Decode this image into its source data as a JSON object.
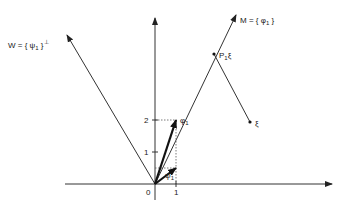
{
  "diagram": {
    "labels": {
      "W": "W = { ψ",
      "W_sub": "1",
      "W_close": " }",
      "W_perp": "⊥",
      "M": "M = { φ",
      "M_sub": "1",
      "M_close": " }",
      "P1xi": "P",
      "P1xi_sub": "1",
      "P1xi_tail": "ξ",
      "xi": "ξ",
      "phi1": "φ",
      "phi1_sub": "1",
      "psi1": "ψ",
      "psi1_sub": "1",
      "origin": "0",
      "x_tick_1": "1",
      "y_tick_1": "1",
      "y_tick_2": "2"
    },
    "colors": {
      "line": "#333333",
      "bold_vector": "#111111",
      "dotted": "#555555"
    }
  }
}
